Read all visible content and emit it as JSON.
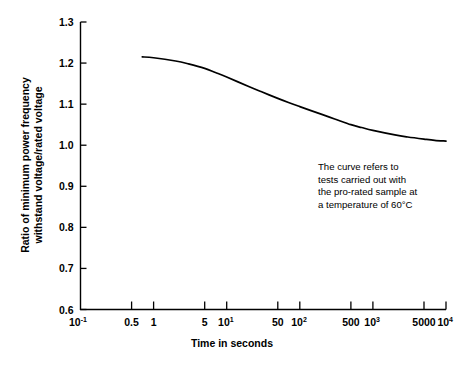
{
  "chart_data": {
    "type": "line",
    "title": "",
    "xlabel": "Time in seconds",
    "ylabel_line1": "Ratio of minimum power frequency",
    "ylabel_line2": "withstand voltage/rated voltage",
    "xscale": "log",
    "xlim": [
      0.1,
      10000
    ],
    "ylim": [
      0.6,
      1.3
    ],
    "grid": false,
    "legend": "none",
    "yticks": [
      "1.3",
      "1.2",
      "1.1",
      "1.0",
      "0.9",
      "0.8",
      "0.7",
      "0.6"
    ],
    "ytick_values": [
      1.3,
      1.2,
      1.1,
      1.0,
      0.9,
      0.8,
      0.7,
      0.6
    ],
    "xticks": [
      {
        "value": 0.1,
        "base": "10",
        "exp": "-1"
      },
      {
        "value": 0.5,
        "base": "0.5",
        "exp": ""
      },
      {
        "value": 1,
        "base": "1",
        "exp": ""
      },
      {
        "value": 5,
        "base": "5",
        "exp": ""
      },
      {
        "value": 10,
        "base": "10",
        "exp": "1"
      },
      {
        "value": 50,
        "base": "50",
        "exp": ""
      },
      {
        "value": 100,
        "base": "10",
        "exp": "2"
      },
      {
        "value": 500,
        "base": "500",
        "exp": ""
      },
      {
        "value": 1000,
        "base": "10",
        "exp": "3"
      },
      {
        "value": 5000,
        "base": "5000",
        "exp": ""
      },
      {
        "value": 10000,
        "base": "10",
        "exp": "4"
      }
    ],
    "series": [
      {
        "name": "minimum power frequency withstand voltage ratio",
        "x": [
          0.7,
          1,
          2,
          3,
          5,
          7,
          10,
          20,
          30,
          50,
          70,
          100,
          200,
          300,
          500,
          700,
          1000,
          2000,
          3000,
          5000,
          7000,
          10000
        ],
        "y": [
          1.215,
          1.213,
          1.205,
          1.198,
          1.187,
          1.177,
          1.166,
          1.143,
          1.13,
          1.114,
          1.104,
          1.094,
          1.075,
          1.064,
          1.05,
          1.043,
          1.036,
          1.025,
          1.02,
          1.015,
          1.012,
          1.01
        ]
      }
    ],
    "annotation": {
      "line1": "The curve refers to",
      "line2": "tests carried out with",
      "line3": "the pro-rated sample at",
      "line4": "a temperature of 60°C"
    },
    "colors": {
      "curve": "#000000",
      "axis": "#000000",
      "background": "#ffffff"
    }
  }
}
